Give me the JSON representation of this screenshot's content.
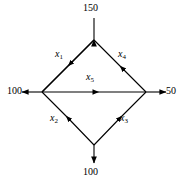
{
  "diagram": {
    "type": "network-flow-diagram",
    "shape": "diamond",
    "stroke_color": "#000000",
    "background_color": "#ffffff",
    "nodes": [
      {
        "id": "top",
        "name": "top-node",
        "x": 94,
        "y": 40
      },
      {
        "id": "left",
        "name": "left-node",
        "x": 42,
        "y": 92
      },
      {
        "id": "right",
        "name": "right-node",
        "x": 146,
        "y": 92
      },
      {
        "id": "bottom",
        "name": "bottom-node",
        "x": 94,
        "y": 145
      }
    ],
    "external_flows": [
      {
        "id": "supply-top",
        "label": "150",
        "direction": "into-top-node",
        "position": "top"
      },
      {
        "id": "demand-left",
        "label": "100",
        "direction": "out-of-left-node",
        "position": "left"
      },
      {
        "id": "demand-right",
        "label": "50",
        "direction": "out-of-right-node",
        "position": "right"
      },
      {
        "id": "demand-bottom",
        "label": "100",
        "direction": "out-of-bottom-node",
        "position": "bottom"
      }
    ],
    "arcs": [
      {
        "id": "x1",
        "var": "x",
        "subscript": "1",
        "from": "top",
        "to": "left",
        "edge": "upper-left"
      },
      {
        "id": "x2",
        "var": "x",
        "subscript": "2",
        "from": "bottom",
        "to": "left",
        "edge": "lower-left"
      },
      {
        "id": "x3",
        "var": "x",
        "subscript": "3",
        "from": "bottom",
        "to": "right",
        "edge": "lower-right"
      },
      {
        "id": "x4",
        "var": "x",
        "subscript": "4",
        "from": "right",
        "to": "top",
        "edge": "upper-right"
      },
      {
        "id": "x5",
        "var": "x",
        "subscript": "5",
        "from": "left",
        "to": "right",
        "edge": "horizontal"
      }
    ]
  }
}
